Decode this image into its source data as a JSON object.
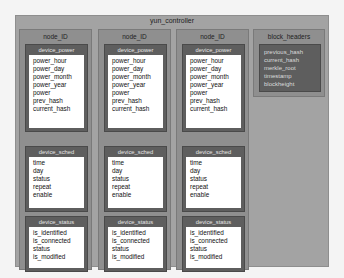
{
  "diagram": {
    "title": "yun_controller",
    "nodes": [
      {
        "title": "node_ID",
        "tables": [
          {
            "title": "device_power",
            "fields": [
              "power_hour",
              "power_day",
              "power_month",
              "power_year",
              "power",
              "prev_hash",
              "current_hash"
            ]
          },
          {
            "title": "device_sched",
            "fields": [
              "time",
              "day",
              "status",
              "repeat",
              "enable"
            ]
          },
          {
            "title": "device_status",
            "fields": [
              "is_identified",
              "is_connected",
              "status",
              "is_modified"
            ]
          }
        ]
      },
      {
        "title": "node_ID",
        "tables": [
          {
            "title": "device_power",
            "fields": [
              "power_hour",
              "power_day",
              "power_month",
              "power_year",
              "power",
              "prev_hash",
              "current_hash"
            ]
          },
          {
            "title": "device_sched",
            "fields": [
              "time",
              "day",
              "status",
              "repeat",
              "enable"
            ]
          },
          {
            "title": "device_status",
            "fields": [
              "is_identified",
              "is_connected",
              "status",
              "is_modified"
            ]
          }
        ]
      },
      {
        "title": "node_ID",
        "tables": [
          {
            "title": "device_power",
            "fields": [
              "power_hour",
              "power_day",
              "power_month",
              "power_year",
              "power",
              "prev_hash",
              "current_hash"
            ]
          },
          {
            "title": "device_sched",
            "fields": [
              "time",
              "day",
              "status",
              "repeat",
              "enable"
            ]
          },
          {
            "title": "device_status",
            "fields": [
              "is_identified",
              "is_connected",
              "status",
              "is_modified"
            ]
          }
        ]
      }
    ],
    "block_headers": {
      "title": "block_headers",
      "fields": [
        "previous_hash",
        "current_hash",
        "merkle_root",
        "timestamp",
        "blockheight"
      ]
    }
  }
}
